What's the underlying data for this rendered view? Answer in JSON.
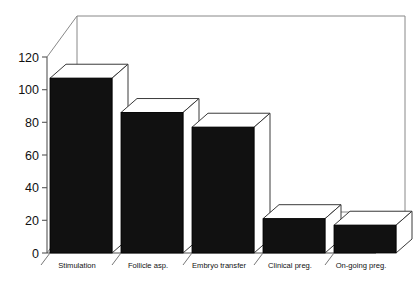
{
  "chart_data": {
    "type": "bar",
    "title": "",
    "subtitle": "",
    "xlabel": "",
    "ylabel": "",
    "categories": [
      "Stimulation",
      "Follicle asp.",
      "Embryo transfer",
      "Clinical preg.",
      "On-going preg."
    ],
    "values": [
      107,
      86,
      77,
      21,
      17
    ],
    "series": [
      {
        "name": "Cycles",
        "values": [
          107,
          86,
          77,
          21,
          17
        ]
      }
    ],
    "ylim": [
      0,
      120
    ],
    "yticks": [
      0,
      20,
      40,
      60,
      80,
      100,
      120
    ],
    "ytick_labels": [
      "0",
      "20",
      "40",
      "60",
      "80",
      "100",
      "120"
    ],
    "grid": false,
    "legend": false,
    "legend_position": "none",
    "style": "3d-bar",
    "bar_color": "#111111",
    "bar_top_color": "#ffffff",
    "bar_side_color": "#ffffff",
    "background": "#ffffff",
    "axis_color": "#555555",
    "annotations": []
  },
  "figure": {
    "width": 419,
    "height": 282
  }
}
